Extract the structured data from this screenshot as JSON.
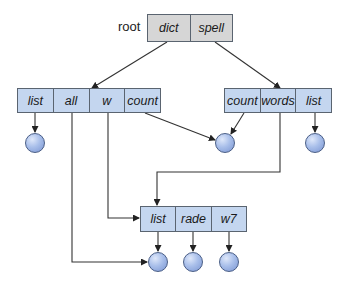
{
  "diagram": {
    "root_label": "root",
    "nodes": {
      "root": {
        "cells": [
          "dict",
          "spell"
        ]
      },
      "left": {
        "cells": [
          "list",
          "all",
          "w",
          "count"
        ]
      },
      "right": {
        "cells": [
          "count",
          "words",
          "list"
        ]
      },
      "bottom": {
        "cells": [
          "list",
          "rade",
          "w7"
        ]
      }
    },
    "leaves": [
      "left-list-leaf",
      "shared-count-leaf",
      "right-list-leaf",
      "bottom-list-leaf",
      "bottom-rade-leaf",
      "bottom-w7-leaf"
    ],
    "edges": [
      {
        "from": "root.dict",
        "to": "left"
      },
      {
        "from": "root.spell",
        "to": "right"
      },
      {
        "from": "left.list",
        "to": "left-list-leaf"
      },
      {
        "from": "left.all",
        "to": "bottom-list-leaf"
      },
      {
        "from": "left.w",
        "to": "bottom"
      },
      {
        "from": "left.count",
        "to": "shared-count-leaf"
      },
      {
        "from": "right.count",
        "to": "shared-count-leaf"
      },
      {
        "from": "right.words",
        "to": "bottom"
      },
      {
        "from": "right.list",
        "to": "right-list-leaf"
      },
      {
        "from": "bottom.list",
        "to": "bottom-list-leaf"
      },
      {
        "from": "bottom.rade",
        "to": "bottom-rade-leaf"
      },
      {
        "from": "bottom.w7",
        "to": "bottom-w7-leaf"
      }
    ],
    "colors": {
      "root_fill": "#d6d6d6",
      "node_fill": "#c4d6ef",
      "leaf_fill": "#a9bfea",
      "stroke": "#333333"
    }
  }
}
